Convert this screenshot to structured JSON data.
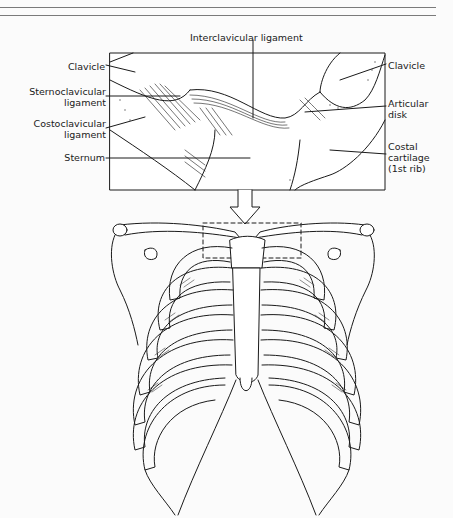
{
  "figure": {
    "title_rules": 2,
    "inset": {
      "description": "Enlarged view of sternoclavicular joint",
      "labels": {
        "top": "Interclavicular ligament",
        "left": [
          {
            "text": [
              "Clavicle"
            ]
          },
          {
            "text": [
              "Sternoclavicular",
              "ligament"
            ]
          },
          {
            "text": [
              "Costoclavicular",
              "ligament"
            ]
          },
          {
            "text": [
              "Sternum"
            ]
          }
        ],
        "right": [
          {
            "text": [
              "Clavicle"
            ]
          },
          {
            "text": [
              "Articular",
              "disk"
            ]
          },
          {
            "text": [
              "Costal",
              "cartilage",
              "(1st rib)"
            ]
          }
        ]
      }
    },
    "main": {
      "description": "Anterior view of thoracic cage with dashed box marking sternoclavicular region"
    },
    "colors": {
      "ink": "#1a1a1a",
      "background": "#fbfbfb",
      "rule": "#7a7a7a"
    }
  }
}
